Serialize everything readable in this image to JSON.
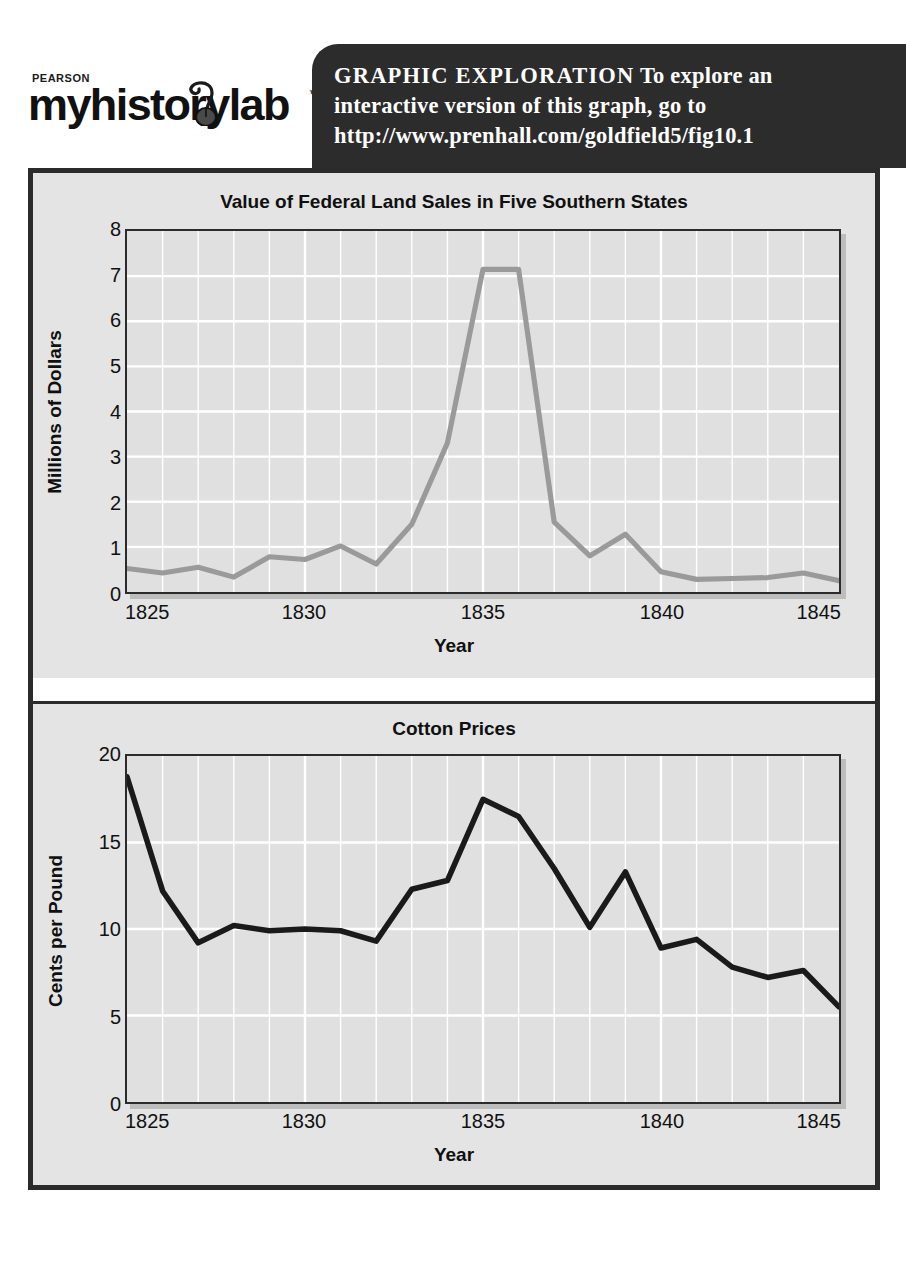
{
  "banner": {
    "logo": {
      "pearson": "PEARSON",
      "wordmark": "myhistorylab",
      "trademark": "™",
      "mouse_icon": "computer-mouse-icon"
    },
    "heading": "GRAPHIC  EXPLORATION",
    "line1_rest": "To explore an",
    "line2": "interactive version of this graph, go to",
    "line3": "http://www.prenhall.com/goldfield5/fig10.1"
  },
  "colors": {
    "banner_background": "#2c2c2c",
    "figure_background": "#e4e4e4",
    "plot_background": "#e0e0e0",
    "frame": "#2b2b2b",
    "gridline": "#ffffff",
    "land_sales_line": "#9a9a9a",
    "cotton_price_line": "#1a1a1a"
  },
  "chart_data": [
    {
      "type": "line",
      "title": "Value of Federal Land Sales in Five Southern States",
      "xlabel": "Year",
      "ylabel": "Millions of Dollars",
      "xlim": [
        1825,
        1845
      ],
      "ylim": [
        0,
        8
      ],
      "xticks": [
        1825,
        1830,
        1835,
        1840,
        1845
      ],
      "yticks": [
        0,
        1,
        2,
        3,
        4,
        5,
        6,
        7,
        8
      ],
      "grid": true,
      "legend": "none",
      "line_color": "#9a9a9a",
      "x": [
        1825,
        1826,
        1827,
        1828,
        1829,
        1830,
        1831,
        1832,
        1833,
        1834,
        1835,
        1836,
        1837,
        1838,
        1839,
        1840,
        1841,
        1842,
        1843,
        1844,
        1845
      ],
      "values": [
        0.52,
        0.42,
        0.55,
        0.33,
        0.78,
        0.72,
        1.02,
        0.62,
        1.5,
        3.3,
        7.15,
        7.15,
        1.55,
        0.8,
        1.28,
        0.45,
        0.28,
        0.3,
        0.32,
        0.42,
        0.25
      ]
    },
    {
      "type": "line",
      "title": "Cotton Prices",
      "xlabel": "Year",
      "ylabel": "Cents per Pound",
      "xlim": [
        1825,
        1845
      ],
      "ylim": [
        0,
        20
      ],
      "xticks": [
        1825,
        1830,
        1835,
        1840,
        1845
      ],
      "yticks": [
        0,
        5,
        10,
        15,
        20
      ],
      "grid": true,
      "legend": "none",
      "line_color": "#1a1a1a",
      "x": [
        1825,
        1826,
        1827,
        1828,
        1829,
        1830,
        1831,
        1832,
        1833,
        1834,
        1835,
        1836,
        1837,
        1838,
        1839,
        1840,
        1841,
        1842,
        1843,
        1844,
        1845
      ],
      "values": [
        18.8,
        12.2,
        9.2,
        10.2,
        9.9,
        10.0,
        9.9,
        9.3,
        12.3,
        12.8,
        17.5,
        16.5,
        13.5,
        10.1,
        13.3,
        8.9,
        9.4,
        7.8,
        7.2,
        7.6,
        5.5
      ]
    }
  ]
}
